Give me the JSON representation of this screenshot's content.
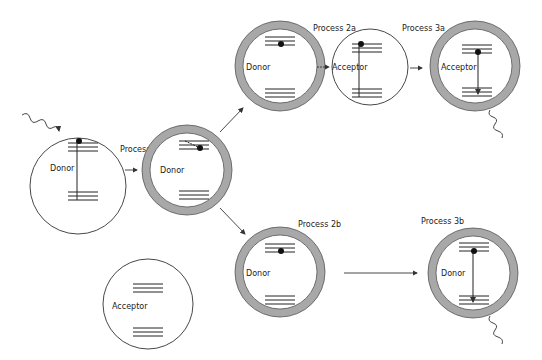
{
  "diagram": {
    "type": "energy-transfer-process-diagram",
    "labels": {
      "donor": "Donor",
      "acceptor": "Acceptor",
      "process_1": "Process 1",
      "process_2a": "Process 2a",
      "process_3a": "Process 3a",
      "process_2b": "Process 2b",
      "process_3b": "Process 3b"
    },
    "nodes": [
      {
        "id": "donor-initial",
        "label": "Donor",
        "shell": false,
        "excited": true
      },
      {
        "id": "donor-shelled",
        "label": "Donor",
        "shell": true,
        "excited": true
      },
      {
        "id": "donor-2a",
        "label": "Donor",
        "shell": true,
        "excited": true
      },
      {
        "id": "acceptor-2a",
        "label": "Acceptor",
        "shell": false,
        "excited": true
      },
      {
        "id": "acceptor-3a",
        "label": "Acceptor",
        "shell": true,
        "emission": true
      },
      {
        "id": "donor-2b",
        "label": "Donor",
        "shell": true,
        "excited": true
      },
      {
        "id": "donor-3b",
        "label": "Donor",
        "shell": true,
        "emission": true
      },
      {
        "id": "acceptor-free",
        "label": "Acceptor",
        "shell": false,
        "excited": false
      }
    ],
    "colors": {
      "shell": "#a8a8a8",
      "line": "#222222",
      "background": "#ffffff"
    }
  }
}
